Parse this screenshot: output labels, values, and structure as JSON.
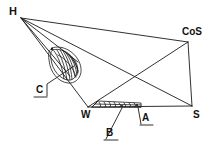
{
  "figure": {
    "background": "#ffffff",
    "stroke": "#1a1a1a",
    "width": 214,
    "height": 153,
    "type": "line-diagram"
  },
  "vertices": {
    "H": {
      "label": "H",
      "x": 21,
      "y": 18
    },
    "CoS": {
      "label": "CoS",
      "x": 188,
      "y": 42
    },
    "S": {
      "label": "S",
      "x": 192,
      "y": 106
    },
    "W": {
      "label": "W",
      "x": 88,
      "y": 107
    }
  },
  "labels": {
    "h": {
      "text": "H",
      "x": 9,
      "y": 7,
      "size": 11
    },
    "cos": {
      "text": "CoS",
      "x": 183,
      "y": 28,
      "size": 10
    },
    "s": {
      "text": "S",
      "x": 194,
      "y": 112,
      "size": 10
    },
    "w": {
      "text": "W",
      "x": 82,
      "y": 112,
      "size": 10
    },
    "a": {
      "text": "A",
      "x": 143,
      "y": 114,
      "size": 10
    },
    "b": {
      "text": "B",
      "x": 107,
      "y": 129,
      "size": 10
    },
    "c": {
      "text": "C",
      "x": 37,
      "y": 86,
      "size": 10
    }
  },
  "callouts": [
    {
      "name": "callout-a",
      "label": "A",
      "underline": [
        [
          141,
          125
        ],
        [
          153,
          125
        ]
      ],
      "leader": [
        [
          141,
          124
        ],
        [
          138,
          107
        ]
      ]
    },
    {
      "name": "callout-b",
      "label": "B",
      "underline": [
        [
          105,
          140
        ],
        [
          118,
          140
        ]
      ],
      "leader": [
        [
          106,
          139
        ],
        [
          122,
          108
        ]
      ]
    },
    {
      "name": "callout-c",
      "label": "C",
      "underline": [
        [
          35,
          97
        ],
        [
          47,
          97
        ]
      ],
      "leader": [
        [
          47,
          96
        ],
        [
          47,
          84
        ],
        [
          75,
          66
        ]
      ]
    }
  ],
  "features": {
    "shell": {
      "name": "shell-oval",
      "center_x": 63,
      "center_y": 66,
      "ribs": 9,
      "description": "ribbed oval shell"
    },
    "strip": {
      "name": "hatched-strip",
      "start_x": 93,
      "start_y": 106,
      "end_x": 140,
      "end_y": 104,
      "scallops": 9,
      "description": "scalloped hatched band"
    }
  },
  "edges": [
    {
      "name": "edge-h-cos",
      "from": "H",
      "to": "CoS"
    },
    {
      "name": "edge-cos-s",
      "from": "CoS",
      "to": "S"
    },
    {
      "name": "edge-s-w",
      "from": "S",
      "to": "W"
    },
    {
      "name": "edge-w-h",
      "from": "W",
      "to": "H"
    },
    {
      "name": "diagonal-h-s",
      "from": "H",
      "to": "S"
    },
    {
      "name": "diagonal-cos-w",
      "from": "CoS",
      "to": "W"
    },
    {
      "name": "ray-h-shell",
      "from": "H",
      "to": "shell"
    }
  ]
}
